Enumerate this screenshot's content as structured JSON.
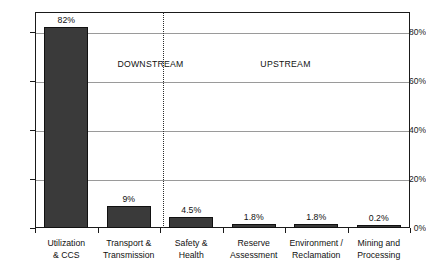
{
  "chart_data": {
    "type": "bar",
    "title": "",
    "subtitle": "",
    "xlabel": "",
    "ylabel": "",
    "ylim": [
      0,
      88
    ],
    "grid": true,
    "legend_position": "none",
    "categories": [
      "Utilization\n& CCS",
      "Transport &\nTransmission",
      "Safety &\nHealth",
      "Reserve\nAssessment",
      "Environment /\nReclamation",
      "Mining and\nProcessing"
    ],
    "category_lines": [
      [
        "Utilization",
        "& CCS"
      ],
      [
        "Transport &",
        "Transmission"
      ],
      [
        "Safety &",
        "Health"
      ],
      [
        "Reserve",
        "Assessment"
      ],
      [
        "Environment /",
        "Reclamation"
      ],
      [
        "Mining and",
        "Processing"
      ]
    ],
    "values": [
      82,
      9,
      4.5,
      1.8,
      1.8,
      0.2
    ],
    "value_labels": [
      "82%",
      "9%",
      "4.5%",
      "1.8%",
      "1.8%",
      "0.2%"
    ],
    "yticks": [
      0,
      20,
      40,
      60,
      80
    ],
    "ytick_labels": [
      "0%",
      "20%",
      "40%",
      "60%",
      "80%"
    ],
    "bar_color": "#3a3a3a",
    "bar_edge_color": "#111111",
    "gridline_color": "#9a9a9a",
    "axis_color": "#1a1a1a",
    "annotations": [
      {
        "text": "DOWNSTREAM",
        "x_pct": 30.8,
        "y_value": 67
      },
      {
        "text": "UPSTREAM",
        "x_pct": 66.8,
        "y_value": 67
      }
    ],
    "divider": {
      "type": "dotted-vertical",
      "x_pct": 34.1
    }
  }
}
